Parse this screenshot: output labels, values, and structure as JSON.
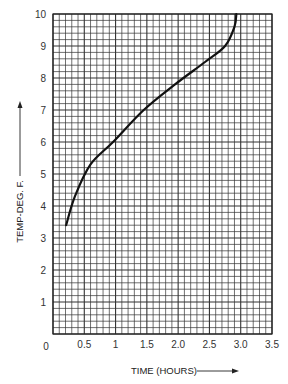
{
  "chart_data": {
    "type": "line",
    "title": "",
    "xlabel": "TIME (HOURS)",
    "ylabel": "TEMP-DEG. F.",
    "xlim": [
      0,
      3.5
    ],
    "ylim": [
      0,
      10
    ],
    "grid": true,
    "x_ticks": [
      "0",
      "0.5",
      "1",
      "1.5",
      "2.0",
      "2.5",
      "3.0",
      "3.5"
    ],
    "x_tick_values": [
      0,
      0.5,
      1,
      1.5,
      2.0,
      2.5,
      3.0,
      3.5
    ],
    "y_ticks": [
      "1",
      "2",
      "3",
      "4",
      "5",
      "6",
      "7",
      "8",
      "9",
      "10"
    ],
    "y_tick_values": [
      1,
      2,
      3,
      4,
      5,
      6,
      7,
      8,
      9,
      10
    ],
    "series": [
      {
        "name": "temperature",
        "x": [
          0.21,
          0.35,
          0.6,
          0.96,
          1.45,
          1.95,
          2.43,
          2.75,
          2.9,
          2.93
        ],
        "y": [
          3.4,
          4.3,
          5.3,
          6.0,
          7.0,
          7.8,
          8.5,
          9.0,
          9.6,
          10.0
        ]
      }
    ]
  }
}
